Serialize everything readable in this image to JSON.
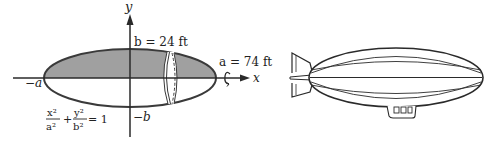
{
  "diagram": {
    "axes": {
      "x_label": "x",
      "y_label": "y"
    },
    "labels": {
      "b_value": "b = 24 ft",
      "a_value": "a = 74 ft",
      "neg_a": "−a",
      "neg_b": "−b"
    },
    "equation": {
      "term1_num": "x²",
      "term1_den": "a²",
      "plus": "+",
      "term2_num": "y²",
      "term2_den": "b²",
      "equals": "= 1"
    },
    "colors": {
      "shaded_region": "#a0a0a0",
      "outline": "#3a3a3a",
      "background": "#ffffff"
    }
  }
}
